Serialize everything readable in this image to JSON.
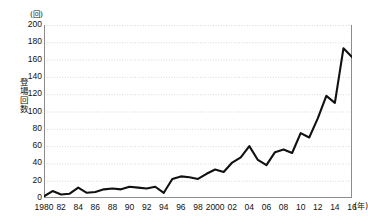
{
  "chart_data": {
    "type": "line",
    "title": "",
    "subtitle": "",
    "xlabel": "(年)",
    "ylabel": "登場回数",
    "yunit": "(回)",
    "xunit": "(年)",
    "ylim": [
      0,
      200
    ],
    "ytick_step": 20,
    "yticks": [
      200,
      180,
      160,
      140,
      120,
      100,
      80,
      60,
      40,
      20,
      0
    ],
    "ytick_labels": [
      "200",
      "180",
      "160",
      "140",
      "120",
      "100",
      "80",
      "60",
      "40",
      "20",
      "0"
    ],
    "grid": true,
    "grid_axis": "y",
    "legend": false,
    "legend_position": "none",
    "line_color": "#111111",
    "grid_color": "#d9d9d9",
    "axis_color": "#8c8c8c",
    "xlim": [
      1980,
      2016
    ],
    "x": [
      1980,
      1981,
      1982,
      1983,
      1984,
      1985,
      1986,
      1987,
      1988,
      1989,
      1990,
      1991,
      1992,
      1993,
      1994,
      1995,
      1996,
      1997,
      1998,
      1999,
      2000,
      2001,
      2002,
      2003,
      2004,
      2005,
      2006,
      2007,
      2008,
      2009,
      2010,
      2011,
      2012,
      2013,
      2014,
      2015,
      2016
    ],
    "xtick_labels": [
      "1980",
      "82",
      "84",
      "86",
      "88",
      "90",
      "92",
      "94",
      "96",
      "98",
      "2000",
      "02",
      "04",
      "06",
      "08",
      "10",
      "12",
      "14",
      "16"
    ],
    "xtick_values": [
      1980,
      1982,
      1984,
      1986,
      1988,
      1990,
      1992,
      1994,
      1996,
      1998,
      2000,
      2002,
      2004,
      2006,
      2008,
      2010,
      2012,
      2014,
      2016
    ],
    "values": [
      2,
      8,
      4,
      5,
      12,
      6,
      7,
      10,
      11,
      10,
      13,
      12,
      11,
      13,
      6,
      22,
      25,
      24,
      22,
      28,
      33,
      30,
      41,
      47,
      60,
      44,
      38,
      53,
      56,
      52,
      75,
      70,
      92,
      118,
      110,
      173,
      163
    ],
    "series": [
      {
        "name": "登場回数",
        "values": [
          2,
          8,
          4,
          5,
          12,
          6,
          7,
          10,
          11,
          10,
          13,
          12,
          11,
          13,
          6,
          22,
          25,
          24,
          22,
          28,
          33,
          30,
          41,
          47,
          60,
          44,
          38,
          53,
          56,
          52,
          75,
          70,
          92,
          118,
          110,
          173,
          163
        ]
      }
    ]
  }
}
